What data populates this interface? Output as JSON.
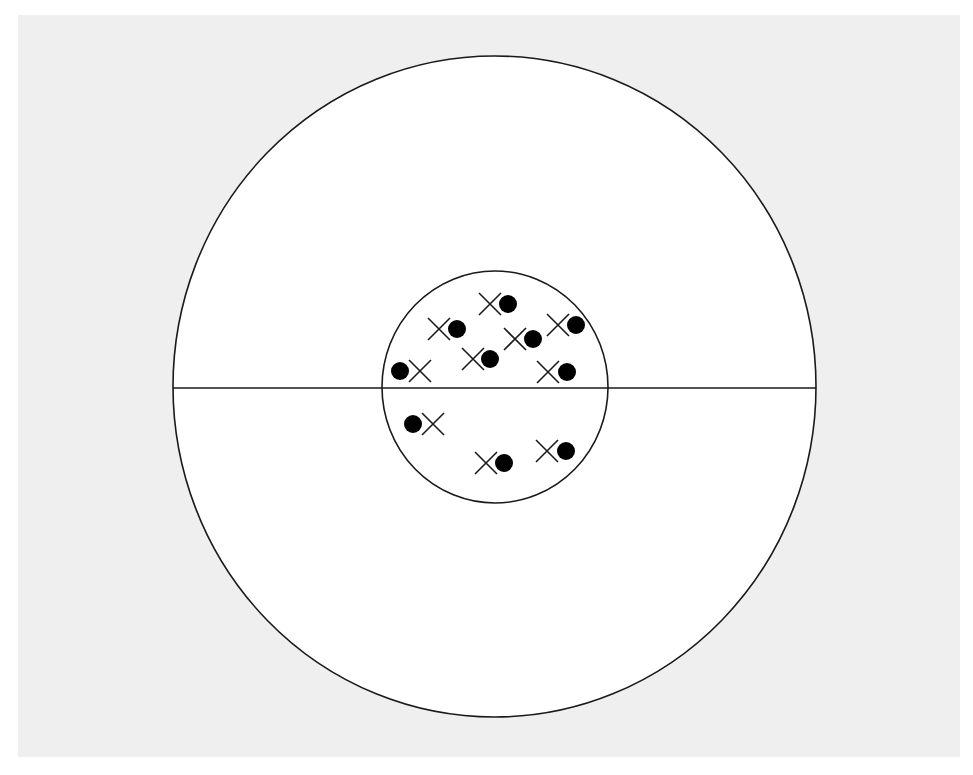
{
  "figure": {
    "background_panel": {
      "x": 18,
      "y": 15,
      "width": 942,
      "height": 742,
      "fill": "#efefef"
    },
    "outer_circle": {
      "cx": 494.5,
      "cy": 386.5,
      "rx": 321.5,
      "ry": 330.5,
      "fill": "#ffffff",
      "stroke": "#1a1a1a",
      "stroke_width": 1.6
    },
    "horizontal_line": {
      "x1": 173,
      "x2": 816,
      "y": 388,
      "stroke": "#1a1a1a",
      "stroke_width": 1.6
    },
    "inner_circle": {
      "cx": 495,
      "cy": 387,
      "rx": 113,
      "ry": 116,
      "fill": "none",
      "stroke": "#1a1a1a",
      "stroke_width": 1.6
    },
    "marker_style": {
      "dot_radius": 9,
      "dot_fill": "#000000",
      "cross_half_size": 11,
      "cross_stroke": "#1a1a1a",
      "cross_stroke_width": 1.6
    },
    "pairs": [
      {
        "order": "cross-dot",
        "cross": {
          "x": 490,
          "y": 304
        },
        "dot": {
          "x": 508,
          "y": 304
        }
      },
      {
        "order": "cross-dot",
        "cross": {
          "x": 439,
          "y": 329
        },
        "dot": {
          "x": 457,
          "y": 329
        }
      },
      {
        "order": "cross-dot",
        "cross": {
          "x": 515,
          "y": 339
        },
        "dot": {
          "x": 533,
          "y": 339
        }
      },
      {
        "order": "cross-dot",
        "cross": {
          "x": 558,
          "y": 325
        },
        "dot": {
          "x": 576,
          "y": 325
        }
      },
      {
        "order": "cross-dot",
        "cross": {
          "x": 473,
          "y": 359
        },
        "dot": {
          "x": 490,
          "y": 359
        }
      },
      {
        "order": "dot-cross",
        "cross": {
          "x": 420,
          "y": 371
        },
        "dot": {
          "x": 400,
          "y": 371
        }
      },
      {
        "order": "cross-dot",
        "cross": {
          "x": 548,
          "y": 372
        },
        "dot": {
          "x": 567,
          "y": 372
        }
      },
      {
        "order": "dot-cross",
        "cross": {
          "x": 433,
          "y": 424
        },
        "dot": {
          "x": 413,
          "y": 424
        }
      },
      {
        "order": "cross-dot",
        "cross": {
          "x": 486,
          "y": 463
        },
        "dot": {
          "x": 504,
          "y": 463
        }
      },
      {
        "order": "cross-dot",
        "cross": {
          "x": 547,
          "y": 451
        },
        "dot": {
          "x": 566,
          "y": 451
        }
      }
    ]
  }
}
